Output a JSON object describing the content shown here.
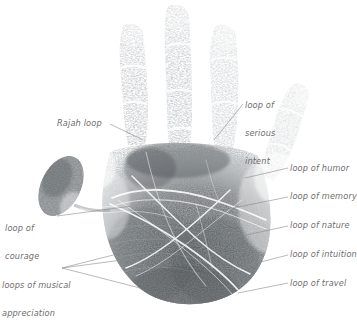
{
  "figure": {
    "background_color": "#ffffff",
    "ink_color": "#6f7376",
    "label_color": "#6e6e6e",
    "leader_line_color": "#8a8a8a"
  },
  "labels": [
    {
      "id": "rajah-loop",
      "text": "Rajah loop",
      "lines": [
        "Rajah loop"
      ],
      "x": 57,
      "y": 119,
      "align": "left"
    },
    {
      "id": "serious-intent",
      "text": "loop of serious intent",
      "lines": [
        "loop of",
        "serious",
        "intent"
      ],
      "x": 245,
      "y": 82,
      "align": "left"
    },
    {
      "id": "humor",
      "text": "loop of humor",
      "lines": [
        "loop of humor"
      ],
      "x": 290,
      "y": 164,
      "align": "left"
    },
    {
      "id": "memory",
      "text": "loop of memory",
      "lines": [
        "loop of memory"
      ],
      "x": 290,
      "y": 192,
      "align": "left"
    },
    {
      "id": "nature",
      "text": "loop of nature",
      "lines": [
        "loop of nature"
      ],
      "x": 290,
      "y": 221,
      "align": "left"
    },
    {
      "id": "intuition",
      "text": "loop of intuition",
      "lines": [
        "loop of intuition"
      ],
      "x": 290,
      "y": 250,
      "align": "left"
    },
    {
      "id": "travel",
      "text": "loop of travel",
      "lines": [
        "loop of travel"
      ],
      "x": 290,
      "y": 279,
      "align": "left"
    },
    {
      "id": "courage",
      "text": "loop of courage",
      "lines": [
        "loop of",
        "courage"
      ],
      "x": 5,
      "y": 205,
      "align": "left"
    },
    {
      "id": "musical-appreciation",
      "text": "loops of musical appreciation",
      "lines": [
        "loops of musical",
        "appreciation"
      ],
      "x": 2,
      "y": 262,
      "align": "left"
    }
  ],
  "leader_lines": [
    {
      "id": "leader-rajah-loop",
      "from": [
        110,
        124
      ],
      "to": [
        143,
        140
      ]
    },
    {
      "id": "leader-serious-intent",
      "from": [
        243,
        104
      ],
      "to": [
        214,
        140
      ]
    },
    {
      "id": "leader-humor",
      "from": [
        288,
        168
      ],
      "to": [
        245,
        178
      ]
    },
    {
      "id": "leader-memory",
      "from": [
        288,
        197
      ],
      "to": [
        228,
        209
      ]
    },
    {
      "id": "leader-nature",
      "from": [
        288,
        226
      ],
      "to": [
        223,
        240
      ]
    },
    {
      "id": "leader-intuition",
      "from": [
        288,
        255
      ],
      "to": [
        245,
        266
      ]
    },
    {
      "id": "leader-travel",
      "from": [
        288,
        283
      ],
      "to": [
        238,
        293
      ]
    },
    {
      "id": "leader-courage",
      "from": [
        57,
        216
      ],
      "to": [
        132,
        206
      ]
    },
    {
      "id": "leader-musical-1",
      "from": [
        62,
        268
      ],
      "to": [
        133,
        250
      ]
    },
    {
      "id": "leader-musical-2",
      "from": [
        62,
        268
      ],
      "to": [
        137,
        258
      ]
    },
    {
      "id": "leader-musical-3",
      "from": [
        62,
        268
      ],
      "to": [
        140,
        288
      ]
    }
  ],
  "handprint_parts": [
    {
      "id": "index-finger",
      "name": "index finger print"
    },
    {
      "id": "middle-finger",
      "name": "middle finger print"
    },
    {
      "id": "ring-finger",
      "name": "ring finger print"
    },
    {
      "id": "little-finger",
      "name": "little finger print"
    },
    {
      "id": "thumb",
      "name": "thumb print"
    },
    {
      "id": "palm",
      "name": "palm print"
    }
  ]
}
